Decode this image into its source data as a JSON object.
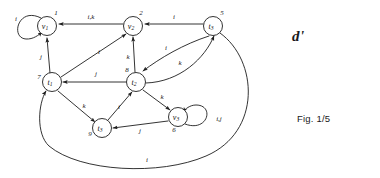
{
  "figure": {
    "title_symbol": "d'",
    "caption": "Fig. 1/5",
    "background_color": "#ffffff",
    "ink_color": "#1d1d1d"
  },
  "graph": {
    "type": "directed-labeled-multigraph",
    "nodes": [
      {
        "id": "v1",
        "label": "v",
        "subscript": "1",
        "index": "1",
        "cx": 47,
        "cy": 26,
        "r": 9.5
      },
      {
        "id": "v2",
        "label": "v",
        "subscript": "2",
        "index": "2",
        "cx": 133,
        "cy": 26,
        "r": 9.5
      },
      {
        "id": "t3",
        "label": "t",
        "subscript": "3",
        "index": "5",
        "cx": 213,
        "cy": 26,
        "r": 9.5
      },
      {
        "id": "t1",
        "label": "t",
        "subscript": "1",
        "index": "7",
        "cx": 52,
        "cy": 82,
        "r": 9.5
      },
      {
        "id": "t2",
        "label": "t",
        "subscript": "2",
        "index": "8",
        "cx": 136,
        "cy": 82,
        "r": 9.5
      },
      {
        "id": "tb",
        "label": "t",
        "subscript": "3",
        "index": "9",
        "cx": 102,
        "cy": 128,
        "r": 9.5
      },
      {
        "id": "v3",
        "label": "v",
        "subscript": "3",
        "index": "6",
        "cx": 178,
        "cy": 117,
        "r": 9.5
      }
    ],
    "edges": [
      {
        "from": "v1",
        "to": "v1",
        "label": "i",
        "kind": "self-loop-left"
      },
      {
        "from": "v2",
        "to": "v1",
        "label": "i,k",
        "kind": "straight"
      },
      {
        "from": "t3",
        "to": "v2",
        "label": "i",
        "kind": "straight"
      },
      {
        "from": "t1",
        "to": "v1",
        "label": "j",
        "kind": "straight"
      },
      {
        "from": "t1",
        "to": "v2",
        "label": "i",
        "kind": "straight"
      },
      {
        "from": "t2",
        "to": "v2",
        "label": "k",
        "kind": "straight"
      },
      {
        "from": "t1",
        "to": "t2",
        "label": "j",
        "kind": "straight"
      },
      {
        "from": "t3",
        "to": "t2",
        "label": "i",
        "kind": "curve"
      },
      {
        "from": "t2",
        "to": "t3",
        "label": "k",
        "kind": "curve"
      },
      {
        "from": "t1",
        "to": "tb",
        "label": "k",
        "kind": "straight"
      },
      {
        "from": "tb",
        "to": "t2",
        "label": "i",
        "kind": "straight"
      },
      {
        "from": "v3",
        "to": "tb",
        "label": "j",
        "kind": "straight"
      },
      {
        "from": "t2",
        "to": "v3",
        "label": "k",
        "kind": "straight"
      },
      {
        "from": "v3",
        "to": "v3",
        "label": "i,j",
        "kind": "self-loop-right"
      },
      {
        "from": "t3",
        "to": "t1",
        "label": "i",
        "kind": "big-outer-curve"
      }
    ],
    "edge_labels": {
      "v1_self": "i",
      "v2_v1": "i,k",
      "t3_v2": "i",
      "t1_v1": "j",
      "t1_v2": "i",
      "t2_v2": "k",
      "t1_t2": "j",
      "t3_t2": "i",
      "t2_t3": "k",
      "t1_tb": "k",
      "tb_t2": "i",
      "v3_tb": "j",
      "t2_v3": "k",
      "v3_self": "i,j",
      "outer": "i"
    }
  }
}
